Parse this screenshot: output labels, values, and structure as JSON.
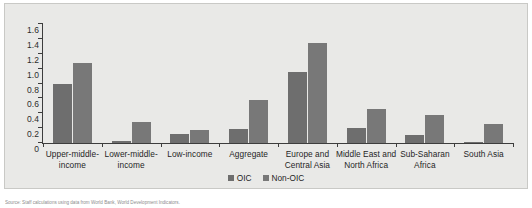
{
  "chart_data": {
    "type": "bar",
    "title": "",
    "xlabel": "",
    "ylabel": "",
    "ylim": [
      0,
      1.6
    ],
    "ytick_labels": [
      "1.6",
      "1.4",
      "1.2",
      "1.0",
      "0.8",
      "0.6",
      "0.4",
      "0.2",
      "0"
    ],
    "ytick_values": [
      1.6,
      1.4,
      1.2,
      1.0,
      0.8,
      0.6,
      0.4,
      0.2,
      0
    ],
    "grid": false,
    "legend_position": "bottom-center",
    "categories": [
      "Upper-middle-income",
      "Lower-middle-income",
      "Low-income",
      "Aggregate",
      "Europe and Central Asia",
      "Middle East and North Africa",
      "Sub-Saharan Africa",
      "South Asia"
    ],
    "category_lines": [
      [
        "Upper-middle-",
        "income"
      ],
      [
        "Lower-middle-",
        "income"
      ],
      [
        "Low-income"
      ],
      [
        "Aggregate"
      ],
      [
        "Europe and",
        "Central Asia"
      ],
      [
        "Middle East and",
        "North Africa"
      ],
      [
        "Sub-Saharan",
        "Africa"
      ],
      [
        "South Asia"
      ]
    ],
    "series": [
      {
        "name": "OIC",
        "color": "#6e6e6e",
        "values": [
          0.79,
          0.03,
          0.12,
          0.19,
          0.95,
          0.2,
          0.11,
          0.02
        ]
      },
      {
        "name": "Non-OIC",
        "color": "#787878",
        "values": [
          1.08,
          0.28,
          0.17,
          0.58,
          1.35,
          0.46,
          0.38,
          0.25
        ]
      }
    ]
  },
  "legend": {
    "items": [
      {
        "label": "OIC"
      },
      {
        "label": "Non-OIC"
      }
    ]
  },
  "caption": {
    "text": "Source: Staff calculations using data from World Bank, World Development Indicators."
  },
  "colors": {
    "panel_background": "#e9e9e7",
    "axis": "#3d3d3d",
    "text": "#1f1f1f",
    "series_oic": "#6e6e6e",
    "series_non_oic": "#787878"
  }
}
